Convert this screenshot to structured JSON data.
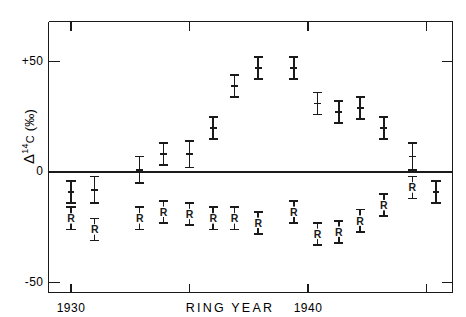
{
  "figure": {
    "width": 466,
    "height": 317,
    "background": "#ffffff",
    "ink_color": "#1a1a1a"
  },
  "axis_labels": {
    "y_delta": "Δ",
    "y_superscript": "14",
    "y_element": "C",
    "y_units": "(‰)",
    "y_full": "Δ14C (‰)",
    "x_title": "RING  YEAR",
    "y_ticks": [
      "+50",
      "0",
      "-50"
    ],
    "x_ticks": [
      "1930",
      "1940"
    ]
  },
  "chart_data": {
    "type": "scatter",
    "title": "",
    "xlabel": "RING  YEAR",
    "ylabel": "Δ14C (‰)",
    "xlim": [
      1928.0,
      1946.5
    ],
    "ylim": [
      -50,
      70
    ],
    "y_ticks": [
      50,
      0,
      -50
    ],
    "y_tick_labels": [
      "+50",
      "0",
      "-50"
    ],
    "x_ticks": [
      1930,
      1935,
      1940,
      1945
    ],
    "x_tick_labels": [
      "1930",
      "",
      "1940",
      ""
    ],
    "grid": false,
    "legend": "none",
    "zero_line": true,
    "error_bars": "vertical",
    "marker_style": "i-beam-error-bar",
    "series": [
      {
        "name": "unlabeled",
        "label_glyph": "",
        "points": [
          {
            "x": 1930.0,
            "y": -9,
            "err": 5
          },
          {
            "x": 1931.0,
            "y": -8,
            "err": 6
          },
          {
            "x": 1932.9,
            "y": 1,
            "err": 6
          },
          {
            "x": 1933.9,
            "y": 8,
            "err": 5
          },
          {
            "x": 1935.0,
            "y": 8,
            "err": 6
          },
          {
            "x": 1936.0,
            "y": 20,
            "err": 5
          },
          {
            "x": 1936.9,
            "y": 39,
            "err": 5
          },
          {
            "x": 1937.9,
            "y": 47,
            "err": 5
          },
          {
            "x": 1939.4,
            "y": 47,
            "err": 5
          },
          {
            "x": 1940.4,
            "y": 31,
            "err": 5
          },
          {
            "x": 1941.3,
            "y": 27,
            "err": 5
          },
          {
            "x": 1942.2,
            "y": 29,
            "err": 5
          },
          {
            "x": 1943.2,
            "y": 20,
            "err": 5
          },
          {
            "x": 1944.4,
            "y": 7,
            "err": 6
          },
          {
            "x": 1945.4,
            "y": -9,
            "err": 5
          }
        ]
      },
      {
        "name": "R",
        "label_glyph": "R",
        "points": [
          {
            "x": 1930.0,
            "y": -21,
            "err": 5
          },
          {
            "x": 1931.0,
            "y": -26,
            "err": 5
          },
          {
            "x": 1932.9,
            "y": -21,
            "err": 5
          },
          {
            "x": 1933.9,
            "y": -18,
            "err": 5
          },
          {
            "x": 1935.0,
            "y": -19,
            "err": 5
          },
          {
            "x": 1936.0,
            "y": -21,
            "err": 5
          },
          {
            "x": 1936.9,
            "y": -21,
            "err": 5
          },
          {
            "x": 1937.9,
            "y": -23,
            "err": 5
          },
          {
            "x": 1939.4,
            "y": -18,
            "err": 5
          },
          {
            "x": 1940.4,
            "y": -28,
            "err": 5
          },
          {
            "x": 1941.3,
            "y": -27,
            "err": 5
          },
          {
            "x": 1942.2,
            "y": -22,
            "err": 5
          },
          {
            "x": 1943.2,
            "y": -15,
            "err": 5
          },
          {
            "x": 1944.4,
            "y": -7,
            "err": 5
          }
        ]
      }
    ]
  }
}
